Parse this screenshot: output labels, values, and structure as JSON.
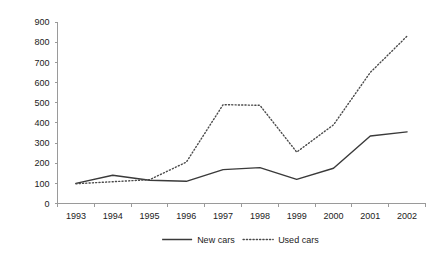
{
  "chart_data": {
    "type": "line",
    "title": "",
    "subtitle": "",
    "xlabel": "",
    "ylabel": "",
    "categories": [
      "1993",
      "1994",
      "1995",
      "1996",
      "1997",
      "1998",
      "1999",
      "2000",
      "2001",
      "2002"
    ],
    "series": [
      {
        "name": "New cars",
        "style": "solid",
        "color": "#3a3a3a",
        "values": [
          100,
          140,
          115,
          110,
          168,
          178,
          120,
          175,
          335,
          355
        ]
      },
      {
        "name": "Used cars",
        "style": "dotted",
        "color": "#4a4a4a",
        "values": [
          98,
          108,
          118,
          205,
          490,
          487,
          255,
          390,
          650,
          830
        ]
      }
    ],
    "ylim": [
      0,
      900
    ],
    "ytick_step": 100,
    "yticks": [
      "0",
      "100",
      "200",
      "300",
      "400",
      "500",
      "600",
      "700",
      "800",
      "900"
    ],
    "grid": false,
    "legend_position": "bottom",
    "legend": [
      {
        "label": "New cars",
        "style": "solid"
      },
      {
        "label": "Used cars",
        "style": "dotted"
      }
    ],
    "axis_color": "#9a9a9a",
    "text_color": "#222222",
    "background": "#ffffff"
  }
}
